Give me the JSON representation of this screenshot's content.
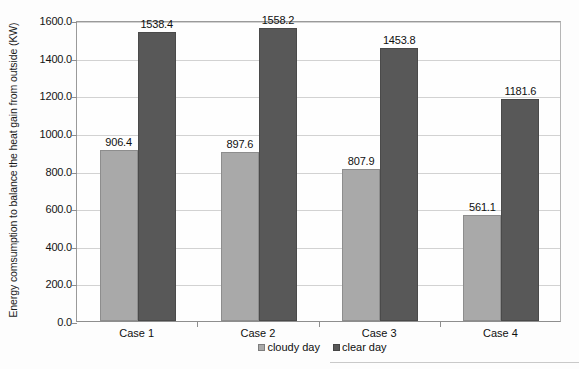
{
  "chart_data": {
    "type": "bar",
    "title": "",
    "xlabel": "",
    "ylabel": "Energy comsumption to balance the heat gain from outside (KW)",
    "categories": [
      "Case 1",
      "Case 2",
      "Case 3",
      "Case 4"
    ],
    "series": [
      {
        "name": "cloudy day",
        "color": "#a9a9a9",
        "values": [
          906.4,
          897.6,
          807.9,
          561.1
        ]
      },
      {
        "name": "clear day",
        "color": "#585858",
        "values": [
          1538.4,
          1558.2,
          1453.8,
          1181.6
        ]
      }
    ],
    "value_labels": [
      [
        "906.4",
        "897.6",
        "807.9",
        "561.1"
      ],
      [
        "1538.4",
        "1558.2",
        "1453.8",
        "1181.6"
      ]
    ],
    "ylim": [
      0.0,
      1600.0
    ],
    "ytick_step": 200.0,
    "ytick_labels": [
      "1600.0",
      "1400.0",
      "1200.0",
      "1000.0",
      "800.0",
      "600.0",
      "400.0",
      "200.0",
      "0.0"
    ],
    "ytick_values": [
      1600.0,
      1400.0,
      1200.0,
      1000.0,
      800.0,
      600.0,
      400.0,
      200.0,
      0.0
    ],
    "grid": true,
    "legend_position": "bottom",
    "legend_entries": [
      "cloudy day",
      "clear day"
    ]
  },
  "axis": {
    "y_title": "Energy comsumption to balance the heat gain from outside (KW)"
  }
}
